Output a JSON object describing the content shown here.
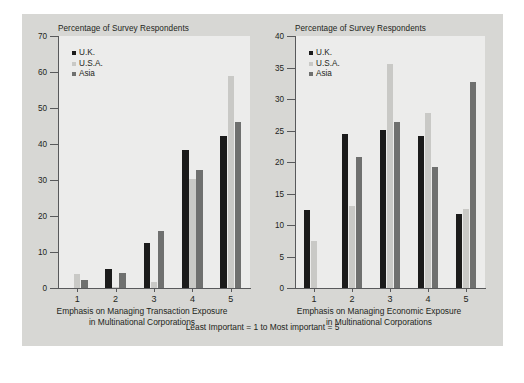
{
  "figure": {
    "background_color": "#d7d7d4",
    "plot_background_color": "#ececeb",
    "caption": "Least Important = 1 to Most important = 5"
  },
  "series_colors": {
    "uk": "#1b1b1b",
    "usa": "#c9c9c6",
    "asia": "#6f706f"
  },
  "legend": {
    "uk": "U.K.",
    "usa": "U.S.A.",
    "asia": "Asia"
  },
  "chart_data": [
    {
      "type": "bar",
      "id": "transaction-exposure",
      "title": "Percentage of Survey Respondents",
      "ylabel": "Percentage of Survey Respondents",
      "xlabel": "Emphasis on Managing Transaction Exposure in Multinational Corporations",
      "xlabel_line1": "Emphasis on Managing Transaction Exposure",
      "xlabel_line2": "in Multinational Corporations",
      "categories": [
        "1",
        "2",
        "3",
        "4",
        "5"
      ],
      "ylim": [
        0,
        70
      ],
      "yticks": [
        0,
        10,
        20,
        30,
        40,
        50,
        60,
        70
      ],
      "grid": false,
      "legend_position": "top-left",
      "series": [
        {
          "name": "U.K.",
          "key": "uk",
          "values": [
            0.0,
            5.4,
            12.4,
            38.2,
            42.2
          ]
        },
        {
          "name": "U.S.A.",
          "key": "usa",
          "values": [
            4.0,
            0.3,
            1.6,
            30.4,
            59.0
          ]
        },
        {
          "name": "Asia",
          "key": "asia",
          "values": [
            2.2,
            4.2,
            15.7,
            32.7,
            46.2
          ]
        }
      ]
    },
    {
      "type": "bar",
      "id": "economic-exposure",
      "title": "Percentage of Survey Respondents",
      "ylabel": "Percentage of Survey Respondents",
      "xlabel": "Emphasis on Managing Economic Exposure in Multinational Corporations",
      "xlabel_line1": "Emphasis on Managing Economic Exposure",
      "xlabel_line2": "in Multinational Corporations",
      "categories": [
        "1",
        "2",
        "3",
        "4",
        "5"
      ],
      "ylim": [
        0,
        40
      ],
      "yticks": [
        0,
        5,
        10,
        15,
        20,
        25,
        30,
        35,
        40
      ],
      "grid": false,
      "legend_position": "top-left",
      "series": [
        {
          "name": "U.K.",
          "key": "uk",
          "values": [
            12.4,
            24.4,
            25.1,
            24.1,
            11.7
          ]
        },
        {
          "name": "U.S.A.",
          "key": "usa",
          "values": [
            7.4,
            13.0,
            35.5,
            27.8,
            12.5
          ]
        },
        {
          "name": "Asia",
          "key": "asia",
          "values": [
            0.0,
            20.8,
            26.4,
            19.2,
            32.7
          ]
        }
      ]
    }
  ]
}
